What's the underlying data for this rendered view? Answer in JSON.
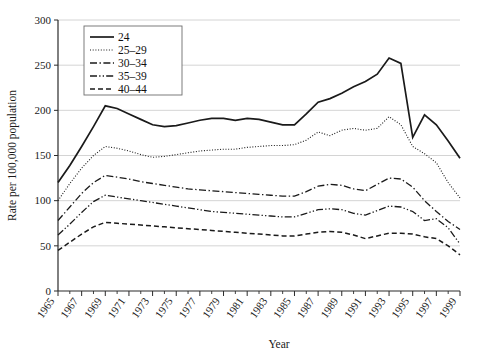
{
  "chart_data": {
    "type": "line",
    "title": "",
    "xlabel": "Year",
    "ylabel": "Rate per 100,000 population",
    "xlim": [
      1965,
      1999
    ],
    "ylim": [
      0,
      300
    ],
    "yticks": [
      0,
      50,
      100,
      150,
      200,
      250,
      300
    ],
    "grid": "horizontal",
    "legend_position": "top-left",
    "xticks": [
      1965,
      1967,
      1969,
      1971,
      1973,
      1975,
      1977,
      1979,
      1981,
      1983,
      1985,
      1987,
      1989,
      1991,
      1993,
      1995,
      1997,
      1999
    ],
    "xticks_minor": [
      1966,
      1968,
      1970,
      1972,
      1974,
      1976,
      1978,
      1980,
      1982,
      1984,
      1986,
      1988,
      1990,
      1992,
      1994,
      1996,
      1998
    ],
    "x": [
      1965,
      1966,
      1967,
      1968,
      1969,
      1970,
      1971,
      1972,
      1973,
      1974,
      1975,
      1976,
      1977,
      1978,
      1979,
      1980,
      1981,
      1982,
      1983,
      1984,
      1985,
      1986,
      1987,
      1988,
      1989,
      1990,
      1991,
      1992,
      1993,
      1994,
      1995,
      1996,
      1997,
      1998,
      1999
    ],
    "series": [
      {
        "name": "24",
        "dash": "none",
        "width": 1.7,
        "values": [
          120,
          139,
          160,
          182,
          205,
          202,
          196,
          190,
          184,
          182,
          183,
          186,
          189,
          191,
          191,
          189,
          191,
          190,
          187,
          184,
          184,
          196,
          209,
          213,
          219,
          226,
          232,
          240,
          258,
          252,
          170,
          195,
          184,
          166,
          147
        ]
      },
      {
        "name": "25–29",
        "dash": "dotted",
        "width": 1.1,
        "values": [
          100,
          119,
          136,
          150,
          160,
          158,
          155,
          151,
          148,
          149,
          151,
          153,
          155,
          156,
          157,
          157,
          159,
          160,
          161,
          161,
          162,
          167,
          176,
          172,
          178,
          180,
          178,
          180,
          193,
          184,
          160,
          152,
          142,
          120,
          103
        ]
      },
      {
        "name": "30–34",
        "dash": "dash-dot",
        "width": 1.3,
        "values": [
          78,
          93,
          108,
          120,
          128,
          126,
          124,
          121,
          119,
          117,
          115,
          113,
          112,
          111,
          110,
          109,
          108,
          107,
          106,
          105,
          105,
          110,
          116,
          118,
          117,
          113,
          111,
          118,
          125,
          124,
          115,
          100,
          88,
          77,
          68
        ]
      },
      {
        "name": "35–39",
        "dash": "dash-dot-dot",
        "width": 1.3,
        "values": [
          62,
          74,
          87,
          99,
          106,
          104,
          102,
          100,
          98,
          96,
          94,
          92,
          90,
          88,
          87,
          86,
          85,
          84,
          83,
          82,
          82,
          86,
          90,
          91,
          90,
          86,
          84,
          89,
          94,
          93,
          88,
          78,
          80,
          70,
          52
        ]
      },
      {
        "name": "40–44",
        "dash": "dashed",
        "width": 1.5,
        "values": [
          45,
          54,
          63,
          71,
          76,
          75,
          74,
          73,
          72,
          71,
          70,
          69,
          68,
          67,
          66,
          65,
          64,
          63,
          62,
          61,
          61,
          63,
          65,
          66,
          65,
          62,
          58,
          61,
          64,
          64,
          63,
          60,
          58,
          50,
          40
        ]
      }
    ]
  }
}
